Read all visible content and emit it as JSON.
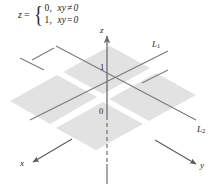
{
  "figure": {
    "background": "#ffffff",
    "plane_fill": "#e2e2e2",
    "line_color": "#7b7b7b",
    "axis_color": "#6e6e6e",
    "text_color": "#231f20"
  },
  "formula": {
    "lhs": "z",
    "equals": "=",
    "brace": "{",
    "case1_value": "0,",
    "case1_cond_left": "xy",
    "case1_cond_op": "≠",
    "case1_cond_right": "0",
    "case2_value": "1,",
    "case2_cond_left": "xy",
    "case2_cond_op": "=",
    "case2_cond_right": "0"
  },
  "axes": {
    "x_label": "x",
    "y_label": "y",
    "z_label": "z"
  },
  "ticks": {
    "one": "1",
    "zero": "0"
  },
  "lines": {
    "l1_label": "L",
    "l1_sub": "1",
    "l2_label": "L",
    "l2_sub": "2"
  }
}
